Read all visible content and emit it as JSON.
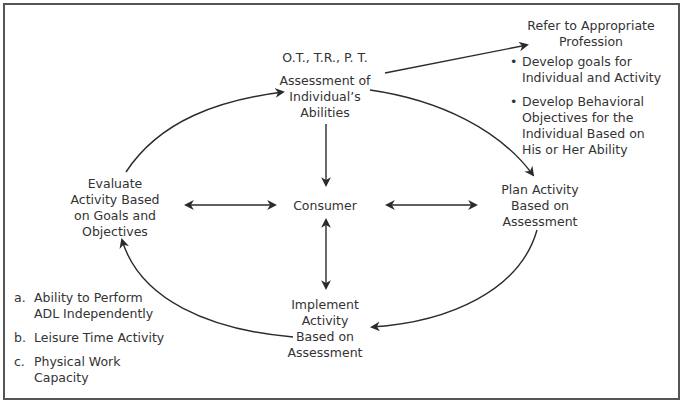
{
  "diagram": {
    "nodes": {
      "assessment": {
        "professions": "O.T., T.R., P. T.",
        "lines": [
          "Assessment of",
          "Individual’s",
          "Abilities"
        ]
      },
      "evaluate": {
        "lines": [
          "Evaluate",
          "Activity Based",
          "on Goals and",
          "Objectives"
        ]
      },
      "consumer": {
        "label": "Consumer"
      },
      "plan": {
        "lines": [
          "Plan Activity",
          "Based on",
          "Assessment"
        ]
      },
      "implement": {
        "lines": [
          "Implement",
          "Activity",
          "Based on",
          "Assessment"
        ]
      }
    },
    "refer_box": {
      "heading_lines": [
        "Refer to Appropriate",
        "Profession"
      ],
      "bullets": [
        {
          "lines": [
            "Develop goals for",
            "Individual and Activity"
          ]
        },
        {
          "lines": [
            "Develop Behavioral",
            "Objectives for the",
            "Individual Based on",
            "His or Her Ability"
          ]
        }
      ]
    },
    "outcomes": [
      {
        "marker": "a.",
        "lines": [
          "Ability to Perform",
          "ADL Independently"
        ]
      },
      {
        "marker": "b.",
        "lines": [
          "Leisure Time Activity"
        ]
      },
      {
        "marker": "c.",
        "lines": [
          "Physical Work",
          "Capacity"
        ]
      }
    ],
    "edges": [
      {
        "from": "evaluate",
        "to": "assessment",
        "type": "curved-arrow"
      },
      {
        "from": "assessment",
        "to": "plan",
        "type": "curved-arrow"
      },
      {
        "from": "plan",
        "to": "implement",
        "type": "curved-arrow"
      },
      {
        "from": "implement",
        "to": "evaluate",
        "type": "curved-arrow"
      },
      {
        "from": "assessment",
        "to": "refer_box",
        "type": "straight-arrow"
      },
      {
        "from": "assessment",
        "to": "consumer",
        "type": "straight-arrow"
      },
      {
        "from": "consumer",
        "to": "implement",
        "type": "double-arrow"
      },
      {
        "from": "consumer",
        "to": "evaluate",
        "type": "double-arrow"
      },
      {
        "from": "consumer",
        "to": "plan",
        "type": "double-arrow"
      }
    ],
    "colors": {
      "line": "#2b2b2b",
      "text": "#333333",
      "border": "#555555"
    }
  }
}
